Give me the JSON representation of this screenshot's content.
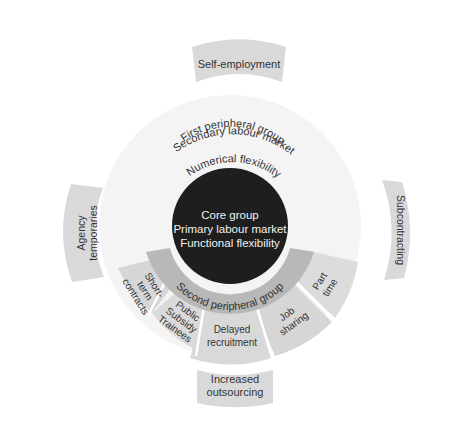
{
  "diagram": {
    "core": {
      "lines": [
        "Core group",
        "Primary labour market",
        "Functional flexibility"
      ],
      "color": "#1e1e1e"
    },
    "first_peripheral": {
      "lines": [
        "First peripheral group",
        "Secondary labour market",
        "Numerical flexibility"
      ],
      "color": "#f5f5f5"
    },
    "second_peripheral": {
      "label": "Second peripheral group",
      "color": "#b8b8b8",
      "segments": [
        {
          "label_lines": [
            "Short-",
            "term",
            "contracts"
          ]
        },
        {
          "label_lines": [
            "Public",
            "Subsidy",
            "Trainees"
          ]
        },
        {
          "label_lines": [
            "Delayed",
            "recruitment"
          ]
        },
        {
          "label_lines": [
            "Job",
            "sharing"
          ]
        },
        {
          "label_lines": [
            "Part",
            "time"
          ]
        }
      ],
      "segment_color": "#d6d6d6"
    },
    "external": {
      "color": "#d9d9d9",
      "top": "Self-employment",
      "left": [
        "Agency",
        "temporaries"
      ],
      "right": "Subcontracting",
      "bottom": [
        "Increased",
        "outsourcing"
      ]
    }
  }
}
